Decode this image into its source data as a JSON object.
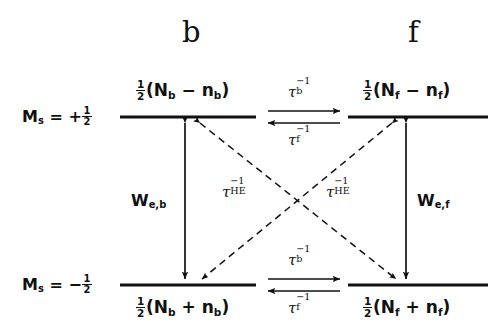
{
  "diagram": {
    "type": "energy-level-kinetic-scheme",
    "columns": [
      {
        "id": "b",
        "header": "b"
      },
      {
        "id": "f",
        "header": "f"
      }
    ],
    "spin_states": [
      {
        "id": "up",
        "label_prefix": "M",
        "label_sub": "s",
        "equals": "=",
        "sign": "+",
        "fraction_num": "1",
        "fraction_den": "2"
      },
      {
        "id": "down",
        "label_prefix": "M",
        "label_sub": "s",
        "equals": "=",
        "sign": "−",
        "fraction_num": "1",
        "fraction_den": "2"
      }
    ],
    "populations": {
      "top_b": {
        "num": "1",
        "den": "2",
        "open": "(N",
        "sub1": "b",
        "op": "−",
        "var": "n",
        "sub2": "b",
        "close": ")"
      },
      "top_f": {
        "num": "1",
        "den": "2",
        "open": "(N",
        "sub1": "f",
        "op": "−",
        "var": "n",
        "sub2": "f",
        "close": ")"
      },
      "bottom_b": {
        "num": "1",
        "den": "2",
        "open": "(N",
        "sub1": "b",
        "op": "+",
        "var": "n",
        "sub2": "b",
        "close": ")"
      },
      "bottom_f": {
        "num": "1",
        "den": "2",
        "open": "(N",
        "sub1": "f",
        "op": "+",
        "var": "n",
        "sub2": "f",
        "close": ")"
      }
    },
    "rates": {
      "tau_b": {
        "symbol": "τ",
        "sub": "b",
        "sup": "−1"
      },
      "tau_f": {
        "symbol": "τ",
        "sub": "f",
        "sup": "−1"
      },
      "tau_HE": {
        "symbol": "τ",
        "sub": "HE",
        "sup": "−1"
      },
      "W_e_b": {
        "symbol": "W",
        "sub": "e,b"
      },
      "W_e_f": {
        "symbol": "W",
        "sub": "e,f"
      }
    },
    "transitions": [
      {
        "name": "top-exchange",
        "label": "tau_b / tau_f",
        "style": "solid",
        "direction": "bidirectional-horizontal",
        "level": "top"
      },
      {
        "name": "bottom-exchange",
        "label": "tau_b / tau_f",
        "style": "solid",
        "direction": "bidirectional-horizontal",
        "level": "bottom"
      },
      {
        "name": "relaxation-b",
        "label": "W_e_b",
        "style": "solid",
        "direction": "bidirectional-vertical",
        "column": "b"
      },
      {
        "name": "relaxation-f",
        "label": "W_e_f",
        "style": "solid",
        "direction": "bidirectional-vertical",
        "column": "f"
      },
      {
        "name": "heisenberg-left",
        "label": "tau_HE",
        "style": "dashed",
        "direction": "bidirectional-diagonal",
        "from": "top-b",
        "to": "bottom-f"
      },
      {
        "name": "heisenberg-right",
        "label": "tau_HE",
        "style": "dashed",
        "direction": "bidirectional-diagonal",
        "from": "top-f",
        "to": "bottom-b"
      }
    ],
    "colors": {
      "ink": "#111111",
      "background": "#ffffff"
    }
  }
}
